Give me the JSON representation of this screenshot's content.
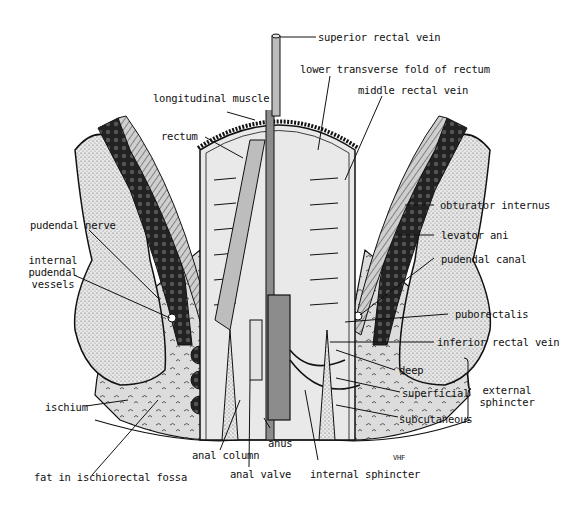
{
  "diagram": {
    "labels": {
      "superior_rectal_vein": "superior rectal vein",
      "lower_transverse_fold": "lower transverse fold of rectum",
      "longitudinal_muscle": "longitudinal muscle",
      "middle_rectal_vein": "middle rectal vein",
      "rectum": "rectum",
      "obturator_internus": "obturator internus",
      "pudendal_nerve": "pudendal nerve",
      "levator_ani": "levator ani",
      "internal_pudendal_vessels_1": "internal",
      "internal_pudendal_vessels_2": "pudendal",
      "internal_pudendal_vessels_3": "vessels",
      "pudendal_canal": "pudendal canal",
      "puborectalis": "puborectalis",
      "inferior_rectal_vein": "inferior rectal vein",
      "deep": "deep",
      "superficial": "superficial",
      "subcutaneous": "subcutaneous",
      "external_sphincter_1": "external",
      "external_sphincter_2": "sphincter",
      "ischium": "ischium",
      "anus": "anus",
      "anal_column": "anal column",
      "anal_valve": "anal valve",
      "internal_sphincter": "internal sphincter",
      "fat_in_ischiorectal_fossa": "fat in ischiorectal fossa",
      "signature": "VHF"
    },
    "colors": {
      "line": "#111111",
      "dark_muscle": "#2a2a2a",
      "gray_fill": "#bdbdbd",
      "light_fill": "#e4e4e4",
      "vein": "#8c8c8c"
    }
  }
}
